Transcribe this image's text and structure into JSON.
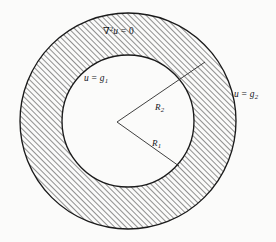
{
  "figure": {
    "name": "annulus-laplace-boundary-value-problem",
    "caption": "",
    "background_color": "#fbfbfa",
    "stroke_color": "#1a1a1a",
    "hatch_color": "#333333"
  },
  "geometry": {
    "center_x": 128,
    "center_y": 121,
    "outer_radius": 108,
    "inner_radius": 66,
    "vertex_x": 117,
    "vertex_y": 122,
    "r2_line_end_x": 205,
    "r2_line_end_y": 62,
    "r1_line_end_x": 179,
    "r1_line_end_y": 166,
    "hatch_angle_deg": 45,
    "hatch_spacing": 4
  },
  "labels": {
    "laplace": {
      "nabla": "∇",
      "exponent": "2",
      "variable": "u",
      "equals": "=",
      "value": "0",
      "full_text": "∇2u = 0"
    },
    "inner_boundary": {
      "variable": "u",
      "equals": "=",
      "function": "g",
      "subscript": "1",
      "full_text": "u = g1"
    },
    "outer_boundary": {
      "variable": "u",
      "equals": "=",
      "function": "g",
      "subscript": "2",
      "full_text": "u = g2"
    },
    "radius_inner": {
      "symbol": "R",
      "subscript": "1",
      "full_text": "R1"
    },
    "radius_outer": {
      "symbol": "R",
      "subscript": "2",
      "full_text": "R2"
    }
  }
}
